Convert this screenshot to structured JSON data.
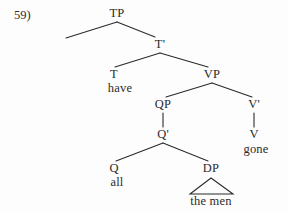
{
  "figure": {
    "item_number": "59)",
    "type": "syntax-tree",
    "sentence": "all the men have gone",
    "ink_color": "#2b2b2b",
    "background_color": "#fdfdfd"
  },
  "nodes": {
    "tp": {
      "label": "TP",
      "x": 117,
      "y": 13
    },
    "tbar": {
      "label": "T'",
      "x": 160,
      "y": 44
    },
    "t": {
      "label": "T",
      "x": 114,
      "y": 74
    },
    "vp": {
      "label": "VP",
      "x": 212,
      "y": 74
    },
    "qp": {
      "label": "QP",
      "x": 163,
      "y": 104
    },
    "vbar": {
      "label": "V'",
      "x": 254,
      "y": 104
    },
    "qbar": {
      "label": "Q'",
      "x": 163,
      "y": 134
    },
    "v": {
      "label": "V",
      "x": 254,
      "y": 134
    },
    "q": {
      "label": "Q",
      "x": 114,
      "y": 168
    },
    "dp": {
      "label": "DP",
      "x": 211,
      "y": 168
    }
  },
  "terminals": {
    "have": {
      "label": "have",
      "x": 114,
      "y": 88
    },
    "gone": {
      "label": "gone",
      "x": 256,
      "y": 149
    },
    "all": {
      "label": "all",
      "x": 114,
      "y": 182
    },
    "themen": {
      "label": "the men",
      "x": 211,
      "y": 201
    }
  },
  "triangle": {
    "name": "dp-triangle",
    "apex_x": 211,
    "apex_y": 178,
    "left_x": 190,
    "right_x": 233,
    "base_y": 194
  },
  "edges": [
    {
      "name": "tp-to-spec",
      "x1": 117,
      "y1": 22,
      "x2": 66,
      "y2": 38
    },
    {
      "name": "tp-to-tbar",
      "x1": 117,
      "y1": 22,
      "x2": 155,
      "y2": 37
    },
    {
      "name": "tbar-to-t",
      "x1": 160,
      "y1": 53,
      "x2": 115,
      "y2": 67
    },
    {
      "name": "tbar-to-vp",
      "x1": 160,
      "y1": 53,
      "x2": 208,
      "y2": 67
    },
    {
      "name": "vp-to-qp",
      "x1": 212,
      "y1": 83,
      "x2": 166,
      "y2": 97
    },
    {
      "name": "vp-to-vbar",
      "x1": 212,
      "y1": 83,
      "x2": 252,
      "y2": 97
    },
    {
      "name": "qp-to-qbar",
      "x1": 163,
      "y1": 113,
      "x2": 163,
      "y2": 127
    },
    {
      "name": "vbar-to-v",
      "x1": 254,
      "y1": 113,
      "x2": 254,
      "y2": 127
    },
    {
      "name": "qbar-to-q",
      "x1": 163,
      "y1": 143,
      "x2": 116,
      "y2": 161
    },
    {
      "name": "qbar-to-dp",
      "x1": 163,
      "y1": 143,
      "x2": 208,
      "y2": 161
    }
  ]
}
